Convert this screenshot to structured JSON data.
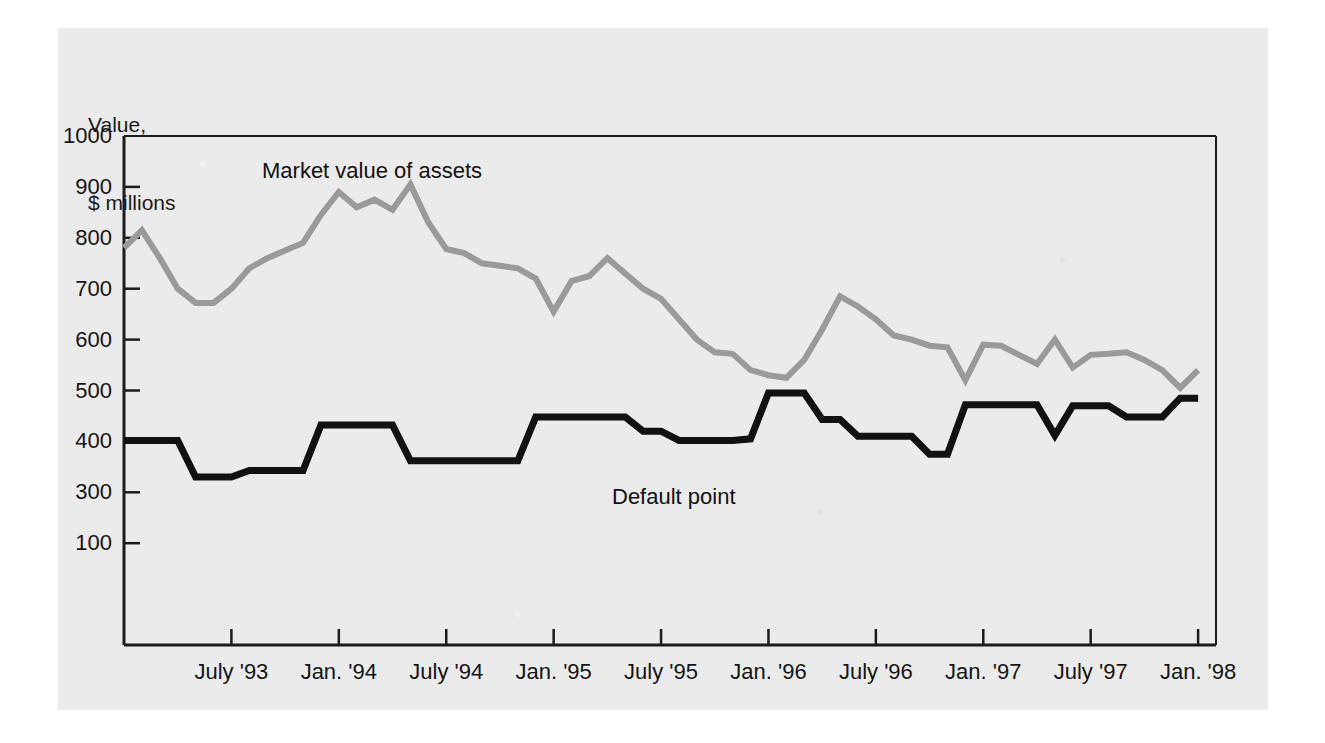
{
  "figure": {
    "name": "market-value-vs-default-point",
    "background_color": "#ebebeb",
    "page_color": "#ffffff"
  },
  "axis": {
    "y_title_line1": "Value,",
    "y_title_line2": "$ millions",
    "y_ticks": [
      {
        "label": "1000",
        "value": 1000
      },
      {
        "label": "900",
        "value": 900
      },
      {
        "label": "800",
        "value": 800
      },
      {
        "label": "700",
        "value": 700
      },
      {
        "label": "600",
        "value": 600
      },
      {
        "label": "500",
        "value": 500
      },
      {
        "label": "400",
        "value": 400
      },
      {
        "label": "300",
        "value": 300
      },
      {
        "label": "100",
        "value": 200
      }
    ],
    "x_ticks": [
      {
        "label": "July '93",
        "month_index": 6
      },
      {
        "label": "Jan. '94",
        "month_index": 12
      },
      {
        "label": "July '94",
        "month_index": 18
      },
      {
        "label": "Jan. '95",
        "month_index": 24
      },
      {
        "label": "July '95",
        "month_index": 30
      },
      {
        "label": "Jan. '96",
        "month_index": 36
      },
      {
        "label": "July '96",
        "month_index": 42
      },
      {
        "label": "Jan. '97",
        "month_index": 48
      },
      {
        "label": "July '97",
        "month_index": 54
      },
      {
        "label": "Jan. '98",
        "month_index": 60
      }
    ]
  },
  "annotations": [
    {
      "name": "market-value-label",
      "text": "Market value of assets",
      "color": "#111111"
    },
    {
      "name": "default-point-label",
      "text": "Default point",
      "color": "#111111"
    }
  ],
  "chart_data": {
    "type": "line",
    "title": "",
    "subtitle": "",
    "xlabel": "",
    "ylabel": "Value, $ millions",
    "ylim": [
      0,
      1000
    ],
    "xlim": [
      0,
      61
    ],
    "grid": false,
    "legend": "inline-annotations",
    "x": [
      "Jan. '93",
      "Feb. '93",
      "Mar. '93",
      "Apr. '93",
      "May '93",
      "June '93",
      "July '93",
      "Aug. '93",
      "Sep. '93",
      "Oct. '93",
      "Nov. '93",
      "Dec. '93",
      "Jan. '94",
      "Feb. '94",
      "Mar. '94",
      "Apr. '94",
      "May '94",
      "June '94",
      "July '94",
      "Aug. '94",
      "Sep. '94",
      "Oct. '94",
      "Nov. '94",
      "Dec. '94",
      "Jan. '95",
      "Feb. '95",
      "Mar. '95",
      "Apr. '95",
      "May '95",
      "June '95",
      "July '95",
      "Aug. '95",
      "Sep. '95",
      "Oct. '95",
      "Nov. '95",
      "Dec. '95",
      "Jan. '96",
      "Feb. '96",
      "Mar. '96",
      "Apr. '96",
      "May '96",
      "June '96",
      "July '96",
      "Aug. '96",
      "Sep. '96",
      "Oct. '96",
      "Nov. '96",
      "Dec. '96",
      "Jan. '97",
      "Feb. '97",
      "Mar. '97",
      "Apr. '97",
      "May '97",
      "June '97",
      "July '97",
      "Aug. '97",
      "Sep. '97",
      "Oct. '97",
      "Nov. '97",
      "Dec. '97",
      "Jan. '98"
    ],
    "series": [
      {
        "name": "Market value of assets",
        "color": "#9a9a9a",
        "linewidth": 6,
        "values": [
          780,
          815,
          760,
          700,
          672,
          672,
          700,
          740,
          760,
          775,
          790,
          845,
          890,
          860,
          875,
          855,
          905,
          830,
          778,
          770,
          750,
          745,
          740,
          720,
          655,
          715,
          725,
          760,
          730,
          700,
          680,
          640,
          600,
          575,
          572,
          540,
          530,
          525,
          560,
          620,
          685,
          665,
          640,
          608,
          600,
          588,
          585,
          520,
          590,
          588,
          570,
          552,
          600,
          545,
          570,
          572,
          575,
          560,
          540,
          505,
          540
        ]
      },
      {
        "name": "Default point",
        "color": "#111111",
        "linewidth": 7,
        "values": [
          402,
          402,
          402,
          402,
          330,
          330,
          330,
          343,
          343,
          343,
          343,
          432,
          432,
          432,
          432,
          432,
          362,
          362,
          362,
          362,
          362,
          362,
          362,
          448,
          448,
          448,
          448,
          448,
          448,
          420,
          420,
          402,
          402,
          402,
          402,
          405,
          495,
          495,
          495,
          443,
          443,
          410,
          410,
          410,
          410,
          375,
          375,
          472,
          472,
          472,
          472,
          472,
          412,
          470,
          470,
          470,
          448,
          448,
          448,
          485,
          485
        ]
      }
    ]
  }
}
